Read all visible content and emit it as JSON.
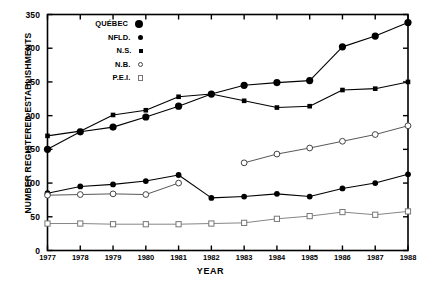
{
  "chart_data": {
    "type": "line",
    "title": "",
    "xlabel": "YEAR",
    "ylabel": "NUMBER REGISTERED ESTABLISHMENTS",
    "x": [
      1977,
      1978,
      1979,
      1980,
      1981,
      1982,
      1983,
      1984,
      1985,
      1986,
      1987,
      1988
    ],
    "xtick_labels": [
      "1977",
      "1978",
      "1979",
      "1980",
      "1981",
      "1982",
      "1983",
      "1984",
      "1985",
      "1986",
      "1987",
      "1988"
    ],
    "ytick_labels": [
      "0",
      "50",
      "100",
      "150",
      "200",
      "250",
      "300",
      "350"
    ],
    "ytick_values": [
      0,
      50,
      100,
      150,
      200,
      250,
      300,
      350
    ],
    "xlim": [
      1977,
      1988
    ],
    "ylim": [
      0,
      350
    ],
    "grid": false,
    "legend_position": "upper-left-inside",
    "series": [
      {
        "name": "QUÉBEC",
        "marker": "filled-circle-large",
        "color": "#000000",
        "x": [
          1977,
          1978,
          1979,
          1980,
          1981,
          1982,
          1983,
          1984,
          1985,
          1986,
          1987,
          1988
        ],
        "values": [
          150,
          176,
          183,
          198,
          214,
          232,
          245,
          249,
          252,
          302,
          318,
          338
        ]
      },
      {
        "name": "N.S.",
        "marker": "filled-square-small",
        "color": "#000000",
        "x": [
          1977,
          1978,
          1979,
          1980,
          1981,
          1982,
          1983,
          1984,
          1985,
          1986,
          1987,
          1988
        ],
        "values": [
          170,
          177,
          201,
          208,
          228,
          232,
          222,
          212,
          214,
          238,
          240,
          250
        ]
      },
      {
        "name": "NFLD.",
        "marker": "filled-circle-medium",
        "color": "#000000",
        "x": [
          1977,
          1978,
          1979,
          1980,
          1981,
          1982,
          1983,
          1984,
          1985,
          1986,
          1987,
          1988
        ],
        "values": [
          85,
          95,
          98,
          103,
          112,
          78,
          80,
          84,
          80,
          92,
          100,
          113
        ]
      },
      {
        "name": "N.B.",
        "marker": "open-circle",
        "color": "#444444",
        "x": [
          1977,
          1978,
          1979,
          1980,
          1981,
          1983,
          1984,
          1985,
          1986,
          1987,
          1988
        ],
        "values": [
          82,
          83,
          84,
          83,
          100,
          130,
          143,
          152,
          162,
          172,
          185
        ],
        "break_after_x": 1981
      },
      {
        "name": "P.E.I.",
        "marker": "open-square",
        "color": "#777777",
        "x": [
          1977,
          1978,
          1979,
          1980,
          1981,
          1982,
          1983,
          1984,
          1985,
          1986,
          1987,
          1988
        ],
        "values": [
          40,
          40,
          39,
          39,
          39,
          40,
          41,
          47,
          51,
          57,
          53,
          58
        ]
      }
    ]
  },
  "legend": {
    "items": [
      {
        "label": "QUÉBEC",
        "marker_name": "quebec-marker-icon"
      },
      {
        "label": "NFLD.",
        "marker_name": "nfld-marker-icon"
      },
      {
        "label": "N.S.",
        "marker_name": "ns-marker-icon"
      },
      {
        "label": "N.B.",
        "marker_name": "nb-marker-icon"
      },
      {
        "label": "P.E.I.",
        "marker_name": "pei-marker-icon"
      }
    ]
  }
}
